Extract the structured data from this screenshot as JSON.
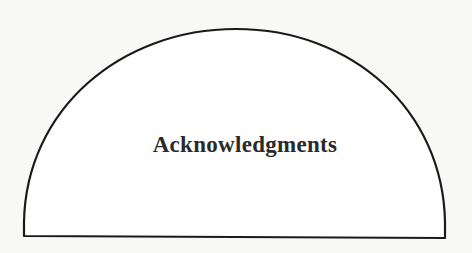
{
  "page": {
    "title": "Acknowledgments"
  },
  "colors": {
    "background": "#f8f8f7",
    "outline": "#1a1a1a",
    "text": "#2a2a2a"
  }
}
